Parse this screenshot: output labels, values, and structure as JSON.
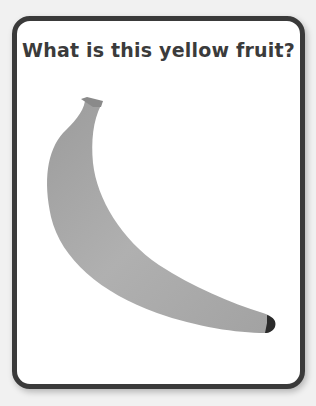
{
  "card": {
    "question": "What is this yellow fruit?",
    "image": {
      "icon": "banana-icon",
      "fill": "#a8a8a8",
      "stem": "#7a7a7a",
      "tip": "#2b2b2b"
    }
  },
  "colors": {
    "background": "#f1f1f1",
    "border": "#3a3a3a",
    "card": "#ffffff",
    "text": "#3b3b3b"
  }
}
